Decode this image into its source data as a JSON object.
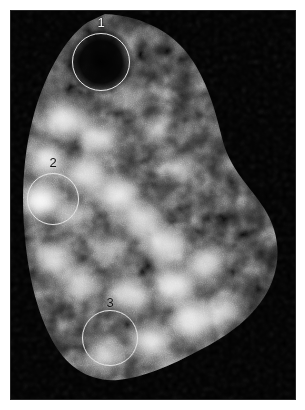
{
  "image": {
    "kind": "grayscale-nuclear-scan",
    "panel": {
      "x": 10,
      "y": 10,
      "width": 286,
      "height": 390,
      "background_color": "#000000",
      "page_background_color": "#ffffff"
    },
    "colormap": "grayscale",
    "alt_text": "Grayscale planar nuclear medicine scan of an organ with mottled uptake and three circled regions of interest"
  },
  "annotations": {
    "outline_color": "#e4e4e4",
    "regions": [
      {
        "id": "roi-1",
        "label": "1",
        "label_color": "#f2f2f2",
        "label_tone": "light",
        "center_x": 101,
        "center_y": 62,
        "radius": 29,
        "label_x": 101,
        "label_y": 22,
        "finding": "cold spot"
      },
      {
        "id": "roi-2",
        "label": "2",
        "label_color": "#141414",
        "label_tone": "dark",
        "center_x": 53,
        "center_y": 199,
        "radius": 26,
        "label_x": 53,
        "label_y": 162,
        "finding": "mixed uptake"
      },
      {
        "id": "roi-3",
        "label": "3",
        "label_color": "#141414",
        "label_tone": "dark",
        "center_x": 110,
        "center_y": 338,
        "radius": 28,
        "label_x": 110,
        "label_y": 302,
        "finding": "mixed uptake"
      }
    ]
  },
  "chart_data": {
    "type": "heatmap",
    "title": "",
    "xlabel": "",
    "ylabel": "",
    "colormap": "grayscale",
    "value_range": [
      0,
      255
    ],
    "grid": false,
    "legend": "none",
    "hotspot_intensities": {
      "roi-1": 35,
      "roi-2": 150,
      "roi-3": 155,
      "background": 6,
      "peak": 245
    }
  }
}
